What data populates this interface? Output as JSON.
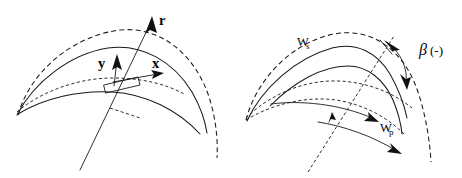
{
  "figure": {
    "name": "blade-coordinate-and-relative-velocity-diagram",
    "background_color": "#ffffff",
    "line_color": "#1a1a1a",
    "width": 462,
    "height": 178,
    "panels": [
      {
        "id": "left-panel",
        "name": "local-blade-coordinate-system",
        "labels": [
          {
            "id": "r",
            "text": "r",
            "role": "radial-axis-label"
          },
          {
            "id": "x",
            "text": "x",
            "role": "x-axis-label"
          },
          {
            "id": "y",
            "text": "y",
            "role": "y-axis-label"
          }
        ],
        "elements": [
          "outer-dashed-arc",
          "inner-dashed-arc",
          "upper-solid-arc",
          "lower-solid-arc",
          "radial-axis-line",
          "blade-element-rectangle",
          "short-dashed-tangent"
        ]
      },
      {
        "id": "right-panel",
        "name": "relative-velocity-and-flow-angle",
        "labels": [
          {
            "id": "ws",
            "text": "W",
            "subscript": "s",
            "role": "suction-side-relative-velocity"
          },
          {
            "id": "wp",
            "text": "W",
            "subscript": "p",
            "role": "pressure-side-relative-velocity"
          },
          {
            "id": "beta",
            "symbol": "β",
            "suffix": "(-)",
            "role": "flow-angle-label"
          }
        ],
        "elements": [
          "outer-dashed-arc",
          "middle-dashed-arc",
          "lower-dashed-arc",
          "suction-blade-curve",
          "pressure-blade-curve",
          "ws-vector-arrow",
          "wp-vector-arrow",
          "radial-dashed-line",
          "tangent-dashed-line",
          "beta-angle-arc-with-double-arrows"
        ]
      }
    ]
  }
}
